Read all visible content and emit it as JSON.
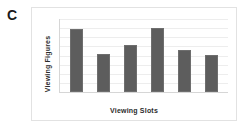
{
  "panel": {
    "letter": "C"
  },
  "chart_data": {
    "type": "bar",
    "title": "",
    "subtitle": "",
    "xlabel": "Viewing Slots",
    "ylabel": "Viewing Figures",
    "categories": [
      "",
      "",
      "",
      "",
      "",
      ""
    ],
    "values": [
      78,
      47,
      58,
      79,
      52,
      46
    ],
    "ylim": [
      0,
      90
    ],
    "xtick_labels": [],
    "ytick_labels": [],
    "grid": true,
    "gridlines": 8,
    "legend": null,
    "legend_position": "none",
    "annotations": [],
    "bar_color": "#5d5d5d",
    "grid_color": "#ededed",
    "axis_color": "#d6d6d6",
    "panel_border_color": "#e2e2e2",
    "background_color": "#ffffff"
  }
}
